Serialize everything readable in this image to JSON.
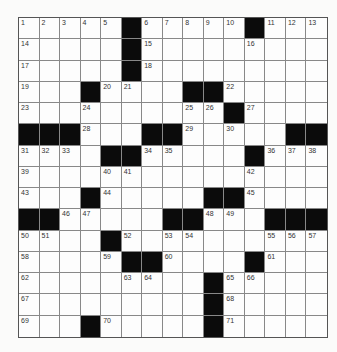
{
  "puzzle": {
    "type": "crossword",
    "rows": 15,
    "cols": 15,
    "black_color": "#0b0b0b",
    "grid": [
      "1,2,3,4,5,#,6,7,8,9,10,#,11,12,13",
      "14,.,.,.,.,#,15,.,.,.,.,16,.,.,.",
      "17,.,.,.,.,#,18,.,.,.,.,.,.,.,.",
      "19,.,.,#,20,21,.,.,#,#,22,.,.,.,.",
      "23,.,.,24,.,.,.,.,25,26,#,27,.,.,.",
      "#,#,#,28,.,.,#,#,29,.,30,.,.,#,#",
      "31,32,33,.,#,#,34,35,.,.,.,#,36,37,38",
      "39,.,.,.,40,41,.,.,.,.,.,42,.,.,.",
      "43,.,.,#,44,.,.,.,.,#,#,45,.,.,.",
      "#,#,46,47,.,.,.,#,#,48,49,.,#,#,#",
      "50,51,.,.,#,52,.,53,54,.,.,.,55,56,57",
      "58,.,.,.,59,#,#,60,.,.,.,#,61,.,.",
      "62,.,.,.,.,63,64,.,.,#,65,66,.,.,.",
      "67,.,.,.,.,.,.,.,.,#,68,.,.,.,.",
      "69,.,.,#,70,.,.,.,.,#,71,.,.,.,."
    ]
  }
}
